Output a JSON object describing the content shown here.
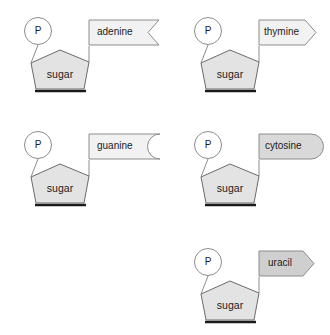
{
  "diagram": {
    "background_color": "#ffffff",
    "shared": {
      "phosphate_label": "P",
      "sugar_label": "sugar",
      "phosphate_fill": "#ffffff",
      "phosphate_stroke": "#8c8c8c",
      "sugar_fill": "#e3e3e3",
      "sugar_stroke": "#6b6b6b",
      "sugar_shadow_color": "#1a1a1a",
      "connector_color": "#8c8c8c"
    },
    "nucleotides": [
      {
        "id": "adenine-nucleotide",
        "base_label": "adenine",
        "base_shape": "ribbon-notched",
        "base_fill": "#f2f2f2",
        "base_stroke": "#8c8c8c",
        "phosphate_label": "P",
        "sugar_label": "sugar",
        "position": "top-left"
      },
      {
        "id": "thymine-nucleotide",
        "base_label": "thymine",
        "base_shape": "arrow-pentagon",
        "base_fill": "#f2f2f2",
        "base_stroke": "#8c8c8c",
        "phosphate_label": "P",
        "sugar_label": "sugar",
        "position": "top-right"
      },
      {
        "id": "guanine-nucleotide",
        "base_label": "guanine",
        "base_shape": "concave-arc",
        "base_fill": "#f2f2f2",
        "base_stroke": "#8c8c8c",
        "phosphate_label": "P",
        "sugar_label": "sugar",
        "position": "middle-left"
      },
      {
        "id": "cytosine-nucleotide",
        "base_label": "cytosine",
        "base_shape": "rounded-stadium",
        "base_fill": "#d9d9d9",
        "base_stroke": "#8c8c8c",
        "phosphate_label": "P",
        "sugar_label": "sugar",
        "position": "middle-right"
      },
      {
        "id": "uracil-nucleotide",
        "base_label": "uracil",
        "base_shape": "arrow-pentagon",
        "base_fill": "#cfcfcf",
        "base_stroke": "#8c8c8c",
        "phosphate_label": "P",
        "sugar_label": "sugar",
        "position": "bottom-right"
      }
    ]
  }
}
